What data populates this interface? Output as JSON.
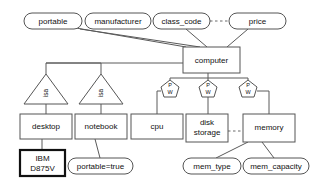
{
  "diagram": {
    "type": "entity-relationship-diagram",
    "colors": {
      "background": "#ffffff",
      "stroke": "#555555",
      "stroke_bold": "#111111",
      "text": "#111111",
      "edge": "#5a5a5a"
    },
    "attributes": [
      {
        "id": "portable",
        "label": "portable",
        "cx": 53,
        "cy": 21,
        "rx": 29,
        "ry": 8
      },
      {
        "id": "manufacturer",
        "label": "manufacturer",
        "cx": 118,
        "cy": 21,
        "rx": 33,
        "ry": 8
      },
      {
        "id": "class_code",
        "label": "class_code",
        "cx": 181,
        "cy": 21,
        "rx": 28,
        "ry": 8
      },
      {
        "id": "price",
        "label": "price",
        "cx": 257,
        "cy": 21,
        "rx": 28,
        "ry": 8
      },
      {
        "id": "portable_true",
        "label": "portable=true",
        "cx": 100,
        "cy": 166,
        "rx": 33,
        "ry": 8
      },
      {
        "id": "mem_type",
        "label": "mem_type",
        "cx": 212,
        "cy": 166,
        "rx": 29,
        "ry": 8
      },
      {
        "id": "mem_capacity",
        "label": "mem_capacity",
        "cx": 276,
        "cy": 166,
        "rx": 33,
        "ry": 8
      }
    ],
    "entities": [
      {
        "id": "computer",
        "label": "computer",
        "x": 183,
        "y": 47,
        "w": 57,
        "h": 26,
        "bold": false
      },
      {
        "id": "desktop",
        "label": "desktop",
        "x": 20,
        "y": 114,
        "w": 52,
        "h": 25,
        "bold": false
      },
      {
        "id": "notebook",
        "label": "notebook",
        "x": 75,
        "y": 114,
        "w": 52,
        "h": 25,
        "bold": false
      },
      {
        "id": "cpu",
        "label": "cpu",
        "x": 131,
        "y": 114,
        "w": 52,
        "h": 25,
        "bold": false
      },
      {
        "id": "disk_storage",
        "label_line1": "disk",
        "label_line2": "storage",
        "x": 186,
        "y": 114,
        "w": 42,
        "h": 28,
        "bold": false
      },
      {
        "id": "memory",
        "label": "memory",
        "x": 243,
        "y": 114,
        "w": 52,
        "h": 28,
        "bold": false
      },
      {
        "id": "ibm_d875v",
        "label_line1": "IBM",
        "label_line2": "D875V",
        "x": 20,
        "y": 150,
        "w": 45,
        "h": 26,
        "bold": true
      }
    ],
    "isa_triangles": [
      {
        "id": "isa-desktop",
        "label": "isa",
        "apex_x": 46,
        "apex_y": 74,
        "base_y": 104,
        "half_w": 22
      },
      {
        "id": "isa-notebook",
        "label": "isa",
        "apex_x": 101,
        "apex_y": 74,
        "base_y": 104,
        "half_w": 22
      }
    ],
    "pw_relationships": [
      {
        "id": "pw-cpu",
        "top_label": "P",
        "bottom_label": "W",
        "cx": 170,
        "cy": 88
      },
      {
        "id": "pw-disk",
        "top_label": "P",
        "bottom_label": "W",
        "cx": 208,
        "cy": 88
      },
      {
        "id": "pw-memory",
        "top_label": "P",
        "bottom_label": "W",
        "cx": 248,
        "cy": 88
      }
    ],
    "dashed_links": [
      {
        "id": "class_code-price",
        "from": "class_code",
        "to": "price"
      },
      {
        "id": "disk_storage-memory",
        "from": "disk_storage",
        "to": "memory"
      }
    ],
    "solid_links": [
      {
        "from": "portable",
        "to": "computer"
      },
      {
        "from": "manufacturer",
        "to": "computer"
      },
      {
        "from": "class_code",
        "to": "computer"
      },
      {
        "from": "price",
        "to": "computer"
      },
      {
        "from": "computer",
        "to": "isa-desktop"
      },
      {
        "from": "computer",
        "to": "isa-notebook"
      },
      {
        "from": "isa-desktop",
        "to": "desktop"
      },
      {
        "from": "isa-notebook",
        "to": "notebook"
      },
      {
        "from": "desktop",
        "to": "ibm_d875v"
      },
      {
        "from": "notebook",
        "to": "portable_true"
      },
      {
        "from": "computer",
        "to": "pw-cpu"
      },
      {
        "from": "computer",
        "to": "pw-disk"
      },
      {
        "from": "computer",
        "to": "pw-memory"
      },
      {
        "from": "pw-cpu",
        "to": "cpu"
      },
      {
        "from": "pw-disk",
        "to": "disk_storage"
      },
      {
        "from": "pw-memory",
        "to": "memory"
      },
      {
        "from": "memory",
        "to": "mem_type"
      },
      {
        "from": "memory",
        "to": "mem_capacity"
      }
    ]
  }
}
